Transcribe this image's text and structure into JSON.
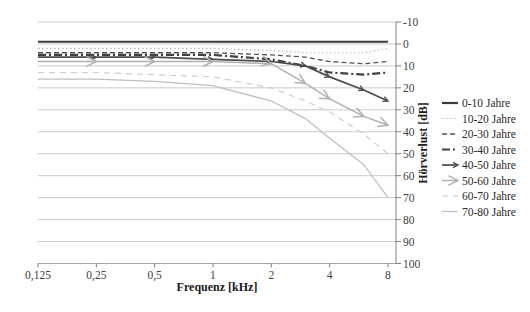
{
  "chart_data": {
    "type": "line",
    "title": "",
    "xlabel": "Frequenz [kHz]",
    "ylabel": "Hörverlust [dB]",
    "x_scale": "log2",
    "x": [
      0.125,
      0.25,
      0.5,
      1,
      2,
      3,
      4,
      6,
      8
    ],
    "x_tick_values": [
      0.125,
      0.25,
      0.5,
      1,
      2,
      4,
      8
    ],
    "x_tick_labels": [
      "0,125",
      "0,25",
      "0,5",
      "1",
      "2",
      "4",
      "8"
    ],
    "y_ticks": [
      -10,
      0,
      10,
      20,
      30,
      40,
      50,
      60,
      70,
      80,
      90,
      100
    ],
    "ylim": [
      -10,
      100
    ],
    "y_inverted": true,
    "grid": "horizontal",
    "legend_position": "right",
    "colors": {
      "dark_line": "#3a3a3a",
      "mid_line": "#4d4d4d",
      "light_line": "#b8b8b8",
      "lighter_line": "#c9c9c9",
      "gridline": "#c9c9c9",
      "axis": "#808080"
    },
    "series": [
      {
        "name": "0-10 Jahre",
        "values": [
          -1,
          -1,
          -1,
          -1,
          -1,
          -1,
          -1,
          -1,
          -1
        ],
        "color": "#3a3a3a",
        "width": 2.2,
        "dash": "",
        "marker": "none"
      },
      {
        "name": "10-20 Jahre",
        "values": [
          2,
          2,
          2,
          2,
          3,
          4,
          4,
          4,
          2
        ],
        "color": "#b5b5b5",
        "width": 1.2,
        "dash": "1.5 2.5",
        "marker": "none"
      },
      {
        "name": "20-30 Jahre",
        "values": [
          4,
          4,
          4,
          4,
          5,
          6,
          8,
          9,
          8
        ],
        "color": "#555555",
        "width": 1.3,
        "dash": "5 3",
        "marker": "none"
      },
      {
        "name": "30-40 Jahre",
        "values": [
          5,
          5,
          5,
          5,
          7,
          10,
          13,
          14,
          13
        ],
        "color": "#404040",
        "width": 2.2,
        "dash": "8 3 2 3",
        "marker": "none"
      },
      {
        "name": "40-50 Jahre",
        "values": [
          6,
          6,
          6,
          7,
          8,
          10,
          15,
          21,
          26
        ],
        "color": "#4d4d4d",
        "width": 1.7,
        "dash": "",
        "marker": "arrow-dark"
      },
      {
        "name": "50-60 Jahre",
        "values": [
          8,
          8,
          8,
          8,
          9,
          18,
          25,
          33,
          37
        ],
        "color": "#b0b0b0",
        "width": 1.5,
        "dash": "",
        "marker": "arrow-gray"
      },
      {
        "name": "60-70 Jahre",
        "values": [
          13,
          13,
          14,
          15,
          20,
          26,
          31,
          41,
          50
        ],
        "color": "#cccccc",
        "width": 1.2,
        "dash": "6 5",
        "marker": "none"
      },
      {
        "name": "70-80 Jahre",
        "values": [
          16,
          16,
          17,
          19,
          26,
          34,
          43,
          55,
          70
        ],
        "color": "#bfbfbf",
        "width": 1.3,
        "dash": "",
        "marker": "none"
      }
    ]
  }
}
